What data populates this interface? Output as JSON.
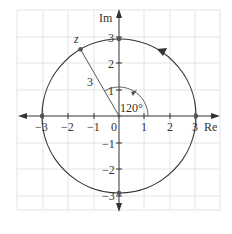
{
  "diagram": {
    "axes": {
      "x_label": "Re",
      "y_label": "Im",
      "origin_label": "0",
      "x_ticks": [
        "−3",
        "−2",
        "−1",
        "1",
        "2",
        "3"
      ],
      "y_ticks": [
        "3",
        "2",
        "1",
        "−1",
        "−2",
        "−3"
      ]
    },
    "circle": {
      "radius": 3,
      "direction": "counterclockwise"
    },
    "point": {
      "label": "z",
      "modulus": 3,
      "argument_deg": 120
    },
    "radius_label": "3",
    "angle_label": "120°",
    "marked_points": [
      "3",
      "3i",
      "−3",
      "−3i"
    ],
    "colors": {
      "line": "#333333",
      "grid": "#e4e4e4",
      "point": "#555555"
    }
  }
}
